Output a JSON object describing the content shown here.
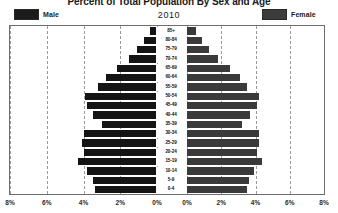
{
  "chart_data": {
    "type": "bar",
    "subtype": "population-pyramid",
    "title": "Percent of Total Population By Sex and Age",
    "year_label": "2010",
    "xlabel": "",
    "ylabel": "",
    "grid": true,
    "legend_position": "top",
    "legend": [
      {
        "name": "Male",
        "color": "#141414",
        "side": "left"
      },
      {
        "name": "Female",
        "color": "#3a3a3a",
        "side": "right"
      }
    ],
    "categories": [
      "85+",
      "80-84",
      "75-79",
      "70-74",
      "65-69",
      "60-64",
      "55-59",
      "50-54",
      "45-49",
      "40-44",
      "35-39",
      "30-34",
      "25-29",
      "20-24",
      "15-19",
      "10-14",
      "5-9",
      "0-4"
    ],
    "axis": {
      "xlim": [
        -8,
        8
      ],
      "unit": "%",
      "left_ticks": [
        "8%",
        "6%",
        "4%",
        "2%",
        "0%"
      ],
      "right_ticks": [
        "0%",
        "2%",
        "4%",
        "6%",
        "8%"
      ],
      "tick_values_left": [
        8,
        6,
        4,
        2,
        0
      ],
      "tick_values_right": [
        0,
        2,
        4,
        6,
        8
      ]
    },
    "series": [
      {
        "name": "Male",
        "color": "#141414",
        "side": "left",
        "values": [
          0.4,
          0.7,
          1.1,
          1.5,
          2.2,
          2.8,
          3.2,
          3.9,
          3.8,
          3.5,
          3.0,
          4.0,
          4.1,
          4.0,
          4.3,
          3.8,
          3.5,
          3.4
        ]
      },
      {
        "name": "Female",
        "color": "#3a3a3a",
        "side": "right",
        "values": [
          0.5,
          0.9,
          1.3,
          1.8,
          2.5,
          3.1,
          3.5,
          4.2,
          4.1,
          3.7,
          3.2,
          4.2,
          4.2,
          4.1,
          4.4,
          3.9,
          3.6,
          3.5
        ]
      }
    ]
  }
}
